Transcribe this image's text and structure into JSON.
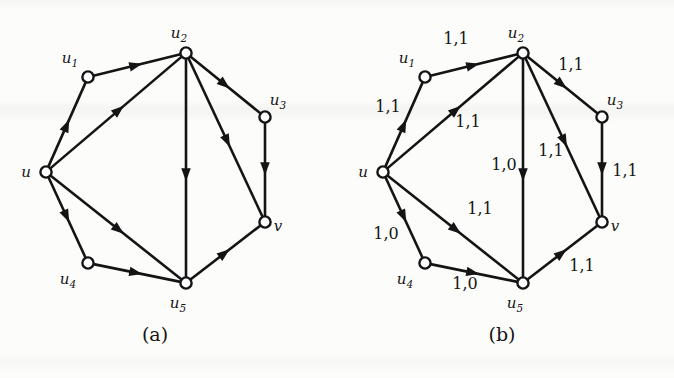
{
  "figure": {
    "background_color": "#fcfcfb",
    "ink_color": "#141414",
    "panels": [
      {
        "id": "a",
        "caption": "(a)",
        "caption_x": 155,
        "caption_y": 341,
        "nodes": [
          {
            "id": "u",
            "label": "u",
            "sub": "",
            "x": 46,
            "y": 172,
            "label_dx": -20,
            "label_dy": 5
          },
          {
            "id": "u1",
            "label": "u",
            "sub": "1",
            "x": 88,
            "y": 77,
            "label_dx": -18,
            "label_dy": -14
          },
          {
            "id": "u2",
            "label": "u",
            "sub": "2",
            "x": 186,
            "y": 53,
            "label_dx": -7,
            "label_dy": -15
          },
          {
            "id": "u3",
            "label": "u",
            "sub": "3",
            "x": 265,
            "y": 117,
            "label_dx": 13,
            "label_dy": -12
          },
          {
            "id": "u4",
            "label": "u",
            "sub": "4",
            "x": 88,
            "y": 263,
            "label_dx": -20,
            "label_dy": 21
          },
          {
            "id": "u5",
            "label": "u",
            "sub": "5",
            "x": 186,
            "y": 283,
            "label_dx": -8,
            "label_dy": 25
          },
          {
            "id": "v",
            "label": "v",
            "sub": "",
            "x": 265,
            "y": 222,
            "label_dx": 13,
            "label_dy": 9
          }
        ],
        "edges": [
          {
            "from": "u",
            "to": "u1",
            "weight": ""
          },
          {
            "from": "u1",
            "to": "u2",
            "weight": ""
          },
          {
            "from": "u",
            "to": "u2",
            "weight": ""
          },
          {
            "from": "u2",
            "to": "u3",
            "weight": ""
          },
          {
            "from": "u2",
            "to": "u5",
            "weight": ""
          },
          {
            "from": "u2",
            "to": "v",
            "weight": ""
          },
          {
            "from": "u3",
            "to": "v",
            "weight": ""
          },
          {
            "from": "u",
            "to": "u4",
            "weight": ""
          },
          {
            "from": "u",
            "to": "u5",
            "weight": ""
          },
          {
            "from": "u4",
            "to": "u5",
            "weight": ""
          },
          {
            "from": "u5",
            "to": "v",
            "weight": ""
          }
        ]
      },
      {
        "id": "b",
        "caption": "(b)",
        "caption_x": 165,
        "caption_y": 341,
        "nodes": [
          {
            "id": "u",
            "label": "u",
            "sub": "",
            "x": 46,
            "y": 172,
            "label_dx": -20,
            "label_dy": 5
          },
          {
            "id": "u1",
            "label": "u",
            "sub": "1",
            "x": 88,
            "y": 77,
            "label_dx": -18,
            "label_dy": -14
          },
          {
            "id": "u2",
            "label": "u",
            "sub": "2",
            "x": 186,
            "y": 53,
            "label_dx": -7,
            "label_dy": -15
          },
          {
            "id": "u3",
            "label": "u",
            "sub": "3",
            "x": 265,
            "y": 117,
            "label_dx": 13,
            "label_dy": -12
          },
          {
            "id": "u4",
            "label": "u",
            "sub": "4",
            "x": 88,
            "y": 263,
            "label_dx": -20,
            "label_dy": 21
          },
          {
            "id": "u5",
            "label": "u",
            "sub": "5",
            "x": 186,
            "y": 283,
            "label_dx": -8,
            "label_dy": 25
          },
          {
            "id": "v",
            "label": "v",
            "sub": "",
            "x": 265,
            "y": 222,
            "label_dx": 13,
            "label_dy": 9
          }
        ],
        "edges": [
          {
            "from": "u",
            "to": "u1",
            "weight": "1,1",
            "wx": 51,
            "wy": 112
          },
          {
            "from": "u1",
            "to": "u2",
            "weight": "1,1",
            "wx": 119,
            "wy": 44
          },
          {
            "from": "u",
            "to": "u2",
            "weight": "1,1",
            "wx": 131,
            "wy": 127
          },
          {
            "from": "u2",
            "to": "u3",
            "weight": "1,1",
            "wx": 234,
            "wy": 70
          },
          {
            "from": "u2",
            "to": "u5",
            "weight": "1,0",
            "wx": 167,
            "wy": 170
          },
          {
            "from": "u2",
            "to": "v",
            "weight": "1,1",
            "wx": 214,
            "wy": 156
          },
          {
            "from": "u3",
            "to": "v",
            "weight": "1,1",
            "wx": 288,
            "wy": 176
          },
          {
            "from": "u",
            "to": "u4",
            "weight": "1,0",
            "wx": 49,
            "wy": 239
          },
          {
            "from": "u",
            "to": "u5",
            "weight": "1,1",
            "wx": 143,
            "wy": 214
          },
          {
            "from": "u4",
            "to": "u5",
            "weight": "1,0",
            "wx": 128,
            "wy": 289
          },
          {
            "from": "u5",
            "to": "v",
            "weight": "1,1",
            "wx": 245,
            "wy": 271
          }
        ]
      }
    ]
  }
}
